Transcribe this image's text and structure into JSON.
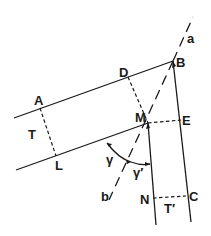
{
  "diagram": {
    "stroke_color": "#1a1a1a",
    "background": "#ffffff",
    "labels": {
      "a": "a",
      "b": "b",
      "A": "A",
      "B": "B",
      "C": "C",
      "D": "D",
      "E": "E",
      "L": "L",
      "M": "M",
      "N": "N",
      "T": "T",
      "T_prime": "T′",
      "gamma": "γ",
      "gamma_prime": "γ′"
    }
  }
}
